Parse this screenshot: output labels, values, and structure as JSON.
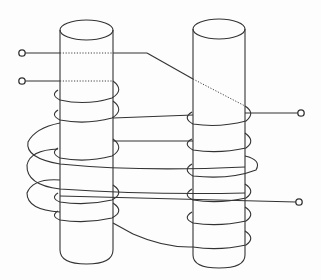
{
  "diagram": {
    "type": "two-limb transformer core with helical windings",
    "stroke_color": "#333333",
    "background_color": "#fdfdfd",
    "limbs": [
      {
        "name": "left-limb",
        "x_left": 60,
        "x_right": 113,
        "top_y": 30,
        "bottom_y": 257
      },
      {
        "name": "right-limb",
        "x_left": 193,
        "x_right": 245,
        "top_y": 29,
        "bottom_y": 262
      }
    ],
    "terminals": [
      {
        "name": "terminal-upper-left",
        "x": 22,
        "y": 53
      },
      {
        "name": "terminal-lower-left",
        "x": 22,
        "y": 81
      },
      {
        "name": "terminal-right-upper",
        "x": 301,
        "y": 113
      },
      {
        "name": "terminal-right-lower",
        "x": 299,
        "y": 202
      }
    ]
  },
  "bleed_through_text": {
    "note": "Mirrored reverse-side page text faintly visible; not legible"
  }
}
